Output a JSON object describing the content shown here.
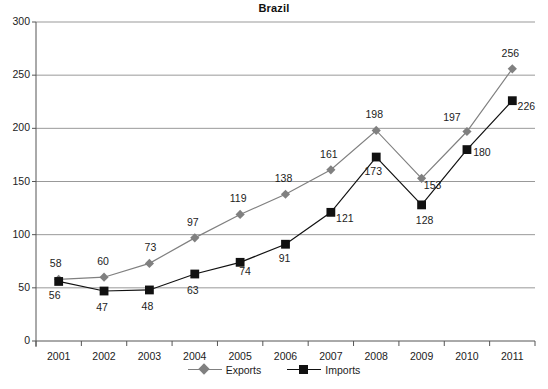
{
  "chart_data": {
    "type": "line",
    "title": "Brazil",
    "xlabel": "",
    "ylabel": "",
    "categories": [
      "2001",
      "2002",
      "2003",
      "2004",
      "2005",
      "2006",
      "2007",
      "2008",
      "2009",
      "2010",
      "2011"
    ],
    "series": [
      {
        "name": "Exports",
        "marker": "diamond",
        "color": "#808080",
        "values": [
          58,
          60,
          73,
          97,
          119,
          138,
          161,
          198,
          153,
          197,
          256
        ]
      },
      {
        "name": "Imports",
        "marker": "square",
        "color": "#111111",
        "values": [
          56,
          47,
          48,
          63,
          74,
          91,
          121,
          173,
          128,
          180,
          226
        ]
      }
    ],
    "ylim": [
      0,
      300
    ],
    "yticks": [
      0,
      50,
      100,
      150,
      200,
      250,
      300
    ],
    "ytick_labels": [
      "0",
      "50",
      "100",
      "150",
      "200",
      "250",
      "300"
    ],
    "grid": true,
    "grid_axis": "y",
    "legend_position": "bottom"
  },
  "colors": {
    "exports": "#808080",
    "imports": "#111111",
    "grid": "#999999",
    "axis": "#555555",
    "text": "#1c1c1c",
    "background": "#ffffff"
  },
  "legend": {
    "items": [
      {
        "label": "Exports"
      },
      {
        "label": "Imports"
      }
    ]
  }
}
